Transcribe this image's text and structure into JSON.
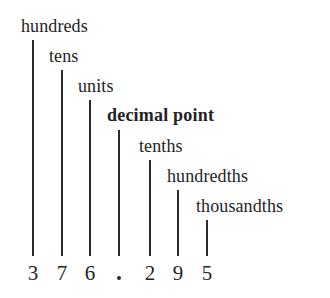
{
  "figure": {
    "background_color": "#ffffff",
    "ink_color": "#232323",
    "rule_color": "#2b2b2b"
  },
  "labels": [
    {
      "id": "hundreds",
      "text": "hundreds",
      "bold": false,
      "x": 21,
      "y": 17
    },
    {
      "id": "tens",
      "text": "tens",
      "bold": false,
      "x": 49,
      "y": 47
    },
    {
      "id": "units",
      "text": "units",
      "bold": false,
      "x": 78,
      "y": 77
    },
    {
      "id": "decimal-point",
      "text": "decimal point",
      "bold": true,
      "x": 107,
      "y": 106
    },
    {
      "id": "tenths",
      "text": "tenths",
      "bold": false,
      "x": 139,
      "y": 137
    },
    {
      "id": "hundredths",
      "text": "hundredths",
      "bold": false,
      "x": 167,
      "y": 167
    },
    {
      "id": "thousandths",
      "text": "thousandths",
      "bold": false,
      "x": 196,
      "y": 197
    }
  ],
  "leader_lines": [
    {
      "id": "leader-hundreds",
      "x": 32,
      "top": 40,
      "bottom": 256
    },
    {
      "id": "leader-tens",
      "x": 61,
      "top": 70,
      "bottom": 256
    },
    {
      "id": "leader-units",
      "x": 89,
      "top": 100,
      "bottom": 256
    },
    {
      "id": "leader-decimal-point",
      "x": 118,
      "top": 130,
      "bottom": 256
    },
    {
      "id": "leader-tenths",
      "x": 149,
      "top": 160,
      "bottom": 256
    },
    {
      "id": "leader-hundredths",
      "x": 177,
      "top": 190,
      "bottom": 256
    },
    {
      "id": "leader-thousandths",
      "x": 206,
      "top": 220,
      "bottom": 256
    }
  ],
  "number": {
    "full_value": "376.295",
    "symbols": [
      {
        "id": "digit-hundreds",
        "text": "3",
        "x": 32,
        "y": 263,
        "is_point": false
      },
      {
        "id": "digit-tens",
        "text": "7",
        "x": 61,
        "y": 263,
        "is_point": false
      },
      {
        "id": "digit-units",
        "text": "6",
        "x": 89,
        "y": 263,
        "is_point": false
      },
      {
        "id": "decimal-point-mark",
        "text": "·",
        "x": 118,
        "y": 263,
        "is_point": true
      },
      {
        "id": "digit-tenths",
        "text": "2",
        "x": 149,
        "y": 263,
        "is_point": false
      },
      {
        "id": "digit-hundredths",
        "text": "9",
        "x": 177,
        "y": 263,
        "is_point": false
      },
      {
        "id": "digit-thousandths",
        "text": "5",
        "x": 206,
        "y": 263,
        "is_point": false
      }
    ]
  }
}
